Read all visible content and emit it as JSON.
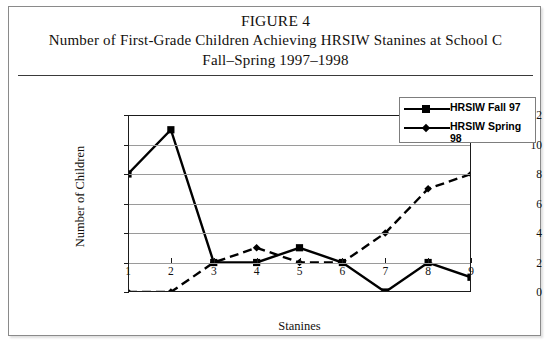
{
  "figure": {
    "title_figure": "FIGURE 4",
    "title_main": "Number of First-Grade Children Achieving HRSIW Stanines at School C",
    "title_sub": "Fall–Spring 1997–1998"
  },
  "legend": {
    "position": "top-right",
    "items": [
      {
        "label": "HRSIW Fall 97",
        "marker": "square-marker-icon",
        "line_style": "solid",
        "color": "#000000"
      },
      {
        "label": "HRSIW Spring 98",
        "marker": "diamond-marker-icon",
        "line_style": "dashed",
        "color": "#000000"
      }
    ]
  },
  "chart_data": {
    "type": "line",
    "title": "Number of First-Grade Children Achieving HRSIW Stanines at School C",
    "subtitle": "Fall–Spring 1997–1998",
    "xlabel": "Stanines",
    "ylabel": "Number of Children",
    "categories": [
      "1",
      "2",
      "3",
      "4",
      "5",
      "6",
      "7",
      "8",
      "9"
    ],
    "x": [
      1,
      2,
      3,
      4,
      5,
      6,
      7,
      8,
      9
    ],
    "xlim": [
      1,
      9
    ],
    "ylim": [
      0,
      12
    ],
    "yticks": [
      0,
      2,
      4,
      6,
      8,
      10,
      12
    ],
    "grid": "horizontal",
    "series": [
      {
        "name": "HRSIW Fall 97",
        "values": [
          8,
          11,
          2,
          2,
          3,
          2,
          0,
          2,
          1
        ],
        "line_style": "solid",
        "marker": "square",
        "color": "#000000"
      },
      {
        "name": "HRSIW Spring 98",
        "values": [
          0,
          0,
          2,
          3,
          2,
          2,
          4,
          7,
          8
        ],
        "line_style": "dashed",
        "marker": "diamond",
        "color": "#000000"
      }
    ]
  }
}
